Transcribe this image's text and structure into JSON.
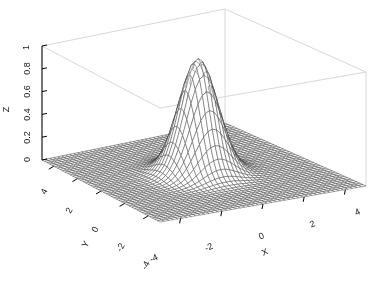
{
  "figure": {
    "background_color": "#ffffff",
    "mesh_color": "#3c3c3c",
    "box_color": "#d8d8d8",
    "axis_color": "#000000",
    "text_color": "#1a1a1a",
    "width": 373,
    "height": 283
  },
  "chart_data": {
    "type": "surface",
    "title": "",
    "subtitle": "",
    "xlabel": "X",
    "ylabel": "Y",
    "zlabel": "Z",
    "xlim": [
      -5,
      5
    ],
    "ylim": [
      -5,
      5
    ],
    "zlim": [
      0,
      1
    ],
    "xticks": [
      -4,
      -2,
      0,
      2,
      4
    ],
    "yticks": [
      -4,
      -2,
      0,
      2,
      4
    ],
    "zticks": [
      0,
      0.2,
      0.4,
      0.6,
      0.8,
      1
    ],
    "xticklabels": [
      "-4",
      "-2",
      "0",
      "2",
      "4"
    ],
    "yticklabels": [
      "-4",
      "-2",
      "0",
      "2",
      "4"
    ],
    "zticklabels": [
      "0",
      "0.2",
      "0.4",
      "0.6",
      "0.8",
      "1"
    ],
    "grid": false,
    "legend": null,
    "shading": "wireframe-mesh",
    "mesh_divisions_x": 46,
    "mesh_divisions_y": 46,
    "view_azimuth_deg": -37.5,
    "view_elevation_deg": 30,
    "surface_function": "gaussian-peak",
    "surface_description": "Single radially-symmetric Gaussian peak centred at (0, 0) reaching z = 1, decaying to a flat z = 0 plane toward the domain edges",
    "peak": {
      "x": 0,
      "y": 0,
      "z": 1
    },
    "gaussian_sigma": 0.85,
    "baseline": 0.0
  },
  "axes": {
    "z": {
      "label": "Z",
      "ticks": [
        {
          "value": 1,
          "label": "1"
        },
        {
          "value": 0.8,
          "label": "0.8"
        },
        {
          "value": 0.6,
          "label": "0.6"
        },
        {
          "value": 0.4,
          "label": "0.4"
        },
        {
          "value": 0.2,
          "label": "0.2"
        },
        {
          "value": 0,
          "label": "0"
        }
      ]
    },
    "y": {
      "label": "Y",
      "ticks": [
        {
          "value": 4,
          "label": "4"
        },
        {
          "value": 2,
          "label": "2"
        },
        {
          "value": 0,
          "label": "0"
        },
        {
          "value": -2,
          "label": "-2"
        },
        {
          "value": -4,
          "label": "-4"
        }
      ]
    },
    "x": {
      "label": "X",
      "ticks": [
        {
          "value": -4,
          "label": "-4"
        },
        {
          "value": -2,
          "label": "-2"
        },
        {
          "value": 0,
          "label": "0"
        },
        {
          "value": 2,
          "label": "2"
        },
        {
          "value": 4,
          "label": "4"
        }
      ]
    }
  }
}
